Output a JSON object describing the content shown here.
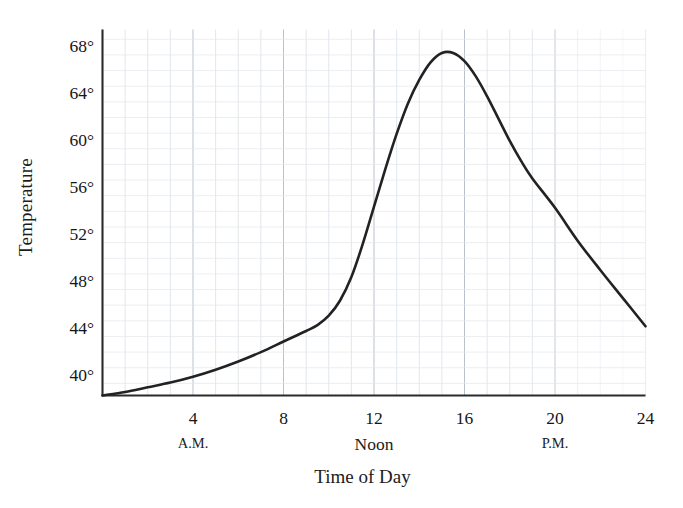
{
  "chart_data": {
    "type": "line",
    "title": "",
    "xlabel": "Time of Day",
    "ylabel": "Temperature",
    "xlim": [
      0,
      24
    ],
    "ylim": [
      38.3,
      69.5
    ],
    "grid": true,
    "legend": null,
    "x_ticks": [
      {
        "value": 4,
        "label": "4"
      },
      {
        "value": 8,
        "label": "8"
      },
      {
        "value": 12,
        "label": "12"
      },
      {
        "value": 16,
        "label": "16"
      },
      {
        "value": 20,
        "label": "20"
      },
      {
        "value": 24,
        "label": "24"
      }
    ],
    "x_sublabels": [
      {
        "value": 4,
        "label": "A.M.",
        "emphasis": "small"
      },
      {
        "value": 12,
        "label": "Noon",
        "emphasis": "large"
      },
      {
        "value": 20,
        "label": "P.M.",
        "emphasis": "small"
      }
    ],
    "y_ticks": [
      {
        "value": 68,
        "label": "68°"
      },
      {
        "value": 64,
        "label": "64°"
      },
      {
        "value": 60,
        "label": "60°"
      },
      {
        "value": 56,
        "label": "56°"
      },
      {
        "value": 52,
        "label": "52°"
      },
      {
        "value": 48,
        "label": "48°"
      },
      {
        "value": 44,
        "label": "44°"
      },
      {
        "value": 40,
        "label": "40°"
      }
    ],
    "minor_grid_divisions": {
      "x": 4,
      "y": 3
    },
    "series": [
      {
        "name": "Temperature",
        "color": "#222222",
        "x": [
          0,
          1,
          2,
          3,
          4,
          5,
          6,
          7,
          8,
          9,
          9.5,
          10,
          10.5,
          11,
          11.5,
          12,
          12.5,
          13,
          13.5,
          14,
          14.5,
          15,
          15.5,
          16,
          16.5,
          17,
          17.5,
          18,
          18.5,
          19,
          20,
          21,
          22,
          23,
          24
        ],
        "y": [
          38.3,
          38.6,
          39.0,
          39.4,
          39.9,
          40.5,
          41.2,
          42.0,
          42.9,
          43.8,
          44.3,
          45.1,
          46.4,
          48.4,
          51.2,
          54.4,
          57.6,
          60.6,
          63.2,
          65.2,
          66.7,
          67.5,
          67.5,
          66.8,
          65.5,
          63.8,
          61.9,
          60.0,
          58.3,
          56.8,
          54.3,
          51.5,
          49.0,
          46.6,
          44.2
        ]
      }
    ],
    "annotations": {
      "peak": {
        "x": 15,
        "y": 67.6
      },
      "start": {
        "x": 0,
        "y": 38.3
      },
      "end": {
        "x": 24,
        "y": 44.2
      }
    },
    "colors": {
      "line": "#222222",
      "axis": "#2b2b2b",
      "major_grid": "#b9c2cc",
      "minor_grid": "#e2e7ec",
      "background": "#ffffff",
      "text": "#161616"
    }
  },
  "figure": {
    "ylabel": "Temperature",
    "xlabel": "Time of Day"
  }
}
